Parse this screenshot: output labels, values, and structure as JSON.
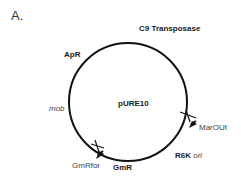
{
  "panel_label": "A.",
  "plasmid": {
    "name": "pURE10",
    "features": [
      {
        "label": "C9 Transposase",
        "style": "bold"
      },
      {
        "label": "ApR",
        "style": "bold"
      },
      {
        "label": "mob",
        "style": "italic"
      },
      {
        "label": "GmR",
        "style": "bold"
      },
      {
        "label": "R6K",
        "style": "bold",
        "suffix": "ori",
        "suffix_style": "italic"
      }
    ],
    "primers": [
      {
        "label": "MarOUt"
      },
      {
        "label": "GmRfor"
      }
    ]
  }
}
